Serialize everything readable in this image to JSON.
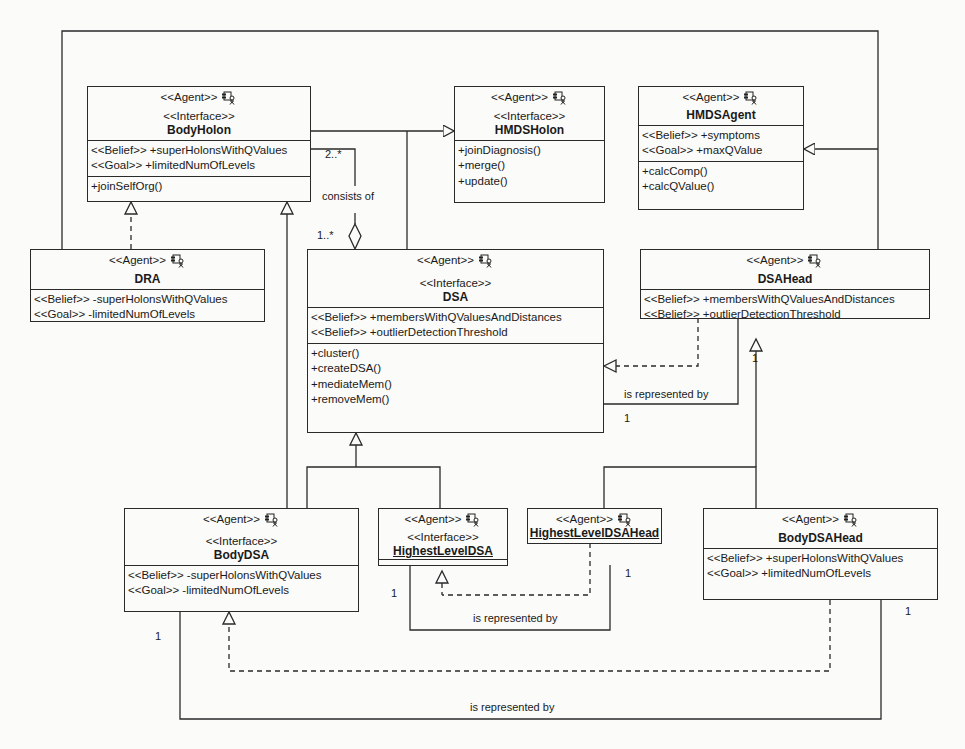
{
  "diagram": {
    "type": "UML class diagram (agent/holon)",
    "classes": {
      "bodyHolon": {
        "stereotypes": [
          "<<Agent>>",
          "<<Interface>>"
        ],
        "name": "BodyHolon",
        "attributes": [
          "<<Belief>> +superHolonsWithQValues",
          "<<Goal>> +limitedNumOfLevels"
        ],
        "operations": [
          "+joinSelfOrg()"
        ]
      },
      "hmdsHolon": {
        "stereotypes": [
          "<<Agent>>",
          "<<Interface>>"
        ],
        "name": "HMDSHolon",
        "attributes": [],
        "operations": [
          "+joinDiagnosis()",
          "+merge()",
          "+update()"
        ]
      },
      "hmdsAgent": {
        "stereotypes": [
          "<<Agent>>"
        ],
        "name": "HMDSAgent",
        "attributes": [
          "<<Belief>> +symptoms",
          "<<Goal>> +maxQValue"
        ],
        "operations": [
          "+calcComp()",
          "+calcQValue()"
        ]
      },
      "dra": {
        "stereotypes": [
          "<<Agent>>"
        ],
        "name": "DRA",
        "attributes": [
          "<<Belief>> -superHolonsWithQValues",
          "<<Goal>> -limitedNumOfLevels"
        ]
      },
      "dsa": {
        "stereotypes": [
          "<<Agent>>",
          "<<Interface>>"
        ],
        "name": "DSA",
        "attributes": [
          "<<Belief>> +membersWithQValuesAndDistances",
          "<<Belief>> +outlierDetectionThreshold"
        ],
        "operations": [
          "+cluster()",
          "+createDSA()",
          "+mediateMem()",
          "+removeMem()"
        ]
      },
      "dsaHead": {
        "stereotypes": [
          "<<Agent>>"
        ],
        "name": "DSAHead",
        "attributes": [
          "<<Belief>> +membersWithQValuesAndDistances",
          "<<Belief>> +outlierDetectionThreshold"
        ]
      },
      "bodyDSA": {
        "stereotypes": [
          "<<Agent>>",
          "<<Interface>>"
        ],
        "name": "BodyDSA",
        "attributes": [
          "<<Belief>> -superHolonsWithQValues",
          "<<Goal>> -limitedNumOfLevels"
        ]
      },
      "highestLevelDSA": {
        "stereotypes": [
          "<<Agent>>",
          "<<Interface>>"
        ],
        "name": "HighestLevelDSA"
      },
      "highestLevelDSAHead": {
        "stereotypes": [
          "<<Agent>>"
        ],
        "name": "HighestLevelDSAHead"
      },
      "bodyDSAHead": {
        "stereotypes": [
          "<<Agent>>"
        ],
        "name": "BodyDSAHead",
        "attributes": [
          "<<Belief>> +superHolonsWithQValues",
          "<<Goal>> +limitedNumOfLevels"
        ]
      }
    },
    "labels": {
      "consistsOf": "consists of",
      "mult2": "2..*",
      "mult1many": "1..*",
      "representedBy1": "is represented by",
      "representedBy2": "is represented by",
      "representedBy3": "is represented by",
      "one_dsaHead": "1",
      "one_dsa": "1",
      "one_hlHead": "1",
      "one_hlDsa": "1",
      "one_bodyDsa": "1",
      "one_bodyDsaHead": "1"
    },
    "icons": {
      "agent": "agent-component-actor-icon"
    },
    "colors": {
      "line": "#2a2a2a",
      "background": "#fbfbf9"
    }
  }
}
